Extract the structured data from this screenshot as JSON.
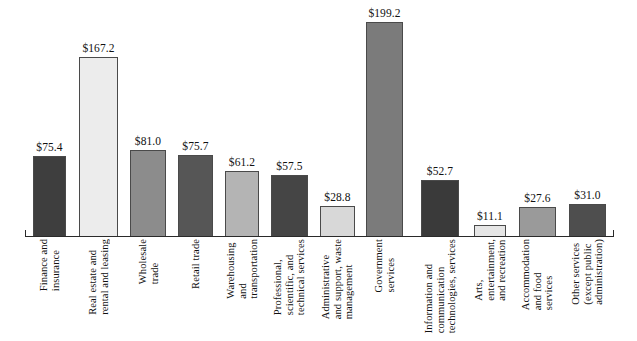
{
  "chart_data": {
    "type": "bar",
    "title": "",
    "subtitle": "",
    "xlabel": "",
    "ylabel": "",
    "ylim": [
      0,
      199.2
    ],
    "grid": false,
    "legend": "none",
    "value_prefix": "$",
    "categories": [
      "Finance and\ninsurance",
      "Real estate and\nrental and leasing",
      "Wholesale\ntrade",
      "Retail trade",
      "Warehousing\nand\ntransportation",
      "Professional,\nscientific, and\ntechnical services",
      "Administrative\nand support, waste\nmanagement",
      "Government\nservices",
      "Information and\ncommunication\ntechnologies, services",
      "Arts,\nentertainment,\nand recreation",
      "Accommodation\nand food\nservices",
      "Other services\n(except public\nadministration)"
    ],
    "values": [
      75.4,
      167.2,
      81.0,
      75.7,
      61.2,
      57.5,
      28.8,
      199.2,
      52.7,
      11.1,
      27.6,
      31.0
    ],
    "value_labels": [
      "$75.4",
      "$167.2",
      "$81.0",
      "$75.7",
      "$61.2",
      "$57.5",
      "$28.8",
      "$199.2",
      "$52.7",
      "$11.1",
      "$27.6",
      "$31.0"
    ],
    "bar_colors": [
      "#3e3e3e",
      "#ececec",
      "#8c8c8c",
      "#565656",
      "#b4b4b4",
      "#454545",
      "#d8d8d8",
      "#7b7b7b",
      "#3a3a3a",
      "#e6e6e6",
      "#9a9a9a",
      "#4e4e4e"
    ],
    "bar_border_color": "#4a4a4a",
    "axis_color": "#2a2a2a",
    "background_color": "#ffffff"
  },
  "layout": {
    "bars": [
      {
        "x": 33,
        "w": 33
      },
      {
        "x": 79,
        "w": 39
      },
      {
        "x": 130,
        "w": 36
      },
      {
        "x": 178,
        "w": 35
      },
      {
        "x": 225,
        "w": 34
      },
      {
        "x": 271,
        "w": 37
      },
      {
        "x": 320,
        "w": 35
      },
      {
        "x": 366,
        "w": 37
      },
      {
        "x": 421,
        "w": 38
      },
      {
        "x": 474,
        "w": 32
      },
      {
        "x": 519,
        "w": 37
      },
      {
        "x": 569,
        "w": 37
      }
    ]
  }
}
